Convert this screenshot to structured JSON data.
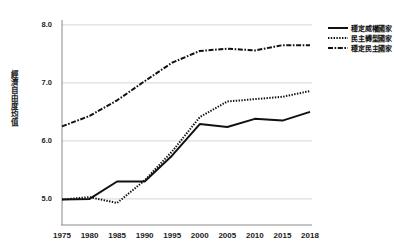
{
  "chart_data": {
    "type": "line",
    "title": "",
    "xlabel": "",
    "ylabel": "經濟自由度均值",
    "x": [
      1975,
      1980,
      1985,
      1990,
      1995,
      2000,
      2005,
      2010,
      2015,
      2018
    ],
    "xticklabels": [
      "1975",
      "1980",
      "1985",
      "1990",
      "1995",
      "2000",
      "2005",
      "2010",
      "2015",
      "2018"
    ],
    "yticklabels": [
      "5.0",
      "6.0",
      "7.0",
      "8.0"
    ],
    "ytickvalues": [
      5.0,
      6.0,
      7.0,
      8.0
    ],
    "ylim": [
      4.55,
      8.05
    ],
    "xlim": [
      1975,
      2018
    ],
    "grid": true,
    "legend_position": "top-right",
    "series": [
      {
        "name": "穩定威權國家",
        "style": "solid",
        "color": "#111111",
        "values": [
          4.99,
          5.0,
          5.3,
          5.3,
          5.75,
          6.29,
          6.24,
          6.38,
          6.35,
          6.5
        ]
      },
      {
        "name": "民主轉型國家",
        "style": "dotted",
        "color": "#111111",
        "values": [
          4.99,
          5.03,
          4.93,
          5.32,
          5.82,
          6.41,
          6.68,
          6.72,
          6.76,
          6.86
        ]
      },
      {
        "name": "穩定民主國家",
        "style": "dashdot",
        "color": "#111111",
        "values": [
          6.25,
          6.43,
          6.7,
          7.03,
          7.35,
          7.55,
          7.59,
          7.56,
          7.65,
          7.65
        ]
      }
    ]
  },
  "axes": {
    "y_label_text": "經濟自由度均值"
  },
  "legend": {
    "items": [
      {
        "label": "穩定威權國家",
        "style": "solid"
      },
      {
        "label": "民主轉型國家",
        "style": "dotted"
      },
      {
        "label": "穩定民主國家",
        "style": "dashdot"
      }
    ]
  }
}
